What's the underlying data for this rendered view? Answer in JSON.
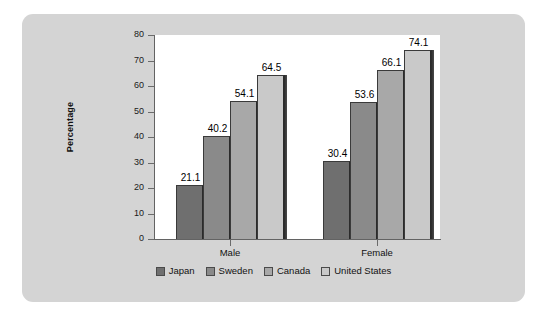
{
  "chart_data": {
    "type": "bar",
    "title": "",
    "xlabel": "",
    "ylabel": "Percentage",
    "ylim": [
      0,
      80
    ],
    "yticks": [
      0,
      10,
      20,
      30,
      40,
      50,
      60,
      70,
      80
    ],
    "grid": false,
    "legend_position": "bottom",
    "categories": [
      "Male",
      "Female"
    ],
    "series": [
      {
        "name": "Japan",
        "values": [
          21.1,
          30.4
        ],
        "color": "#6f6f6f"
      },
      {
        "name": "Sweden",
        "values": [
          40.2,
          53.6
        ],
        "color": "#8a8a8a"
      },
      {
        "name": "Canada",
        "values": [
          54.1,
          66.1
        ],
        "color": "#a8a8a8"
      },
      {
        "name": "United States",
        "values": [
          64.5,
          74.1
        ],
        "color": "#c9c9c9"
      }
    ],
    "value_labels": [
      "21.1",
      "40.2",
      "54.1",
      "64.5",
      "30.4",
      "53.6",
      "66.1",
      "74.1"
    ],
    "panel_background": "#d4d4d4",
    "plot_background": "#ffffff",
    "axis_color": "#636363"
  },
  "legend": {
    "items": [
      {
        "label": "Japan"
      },
      {
        "label": "Sweden"
      },
      {
        "label": "Canada"
      },
      {
        "label": "United States"
      }
    ]
  },
  "axis": {
    "y_label": "Percentage",
    "y_ticks": [
      "80",
      "70",
      "60",
      "50",
      "40",
      "30",
      "20",
      "10",
      "0"
    ],
    "x_groups": [
      "Male",
      "Female"
    ]
  }
}
